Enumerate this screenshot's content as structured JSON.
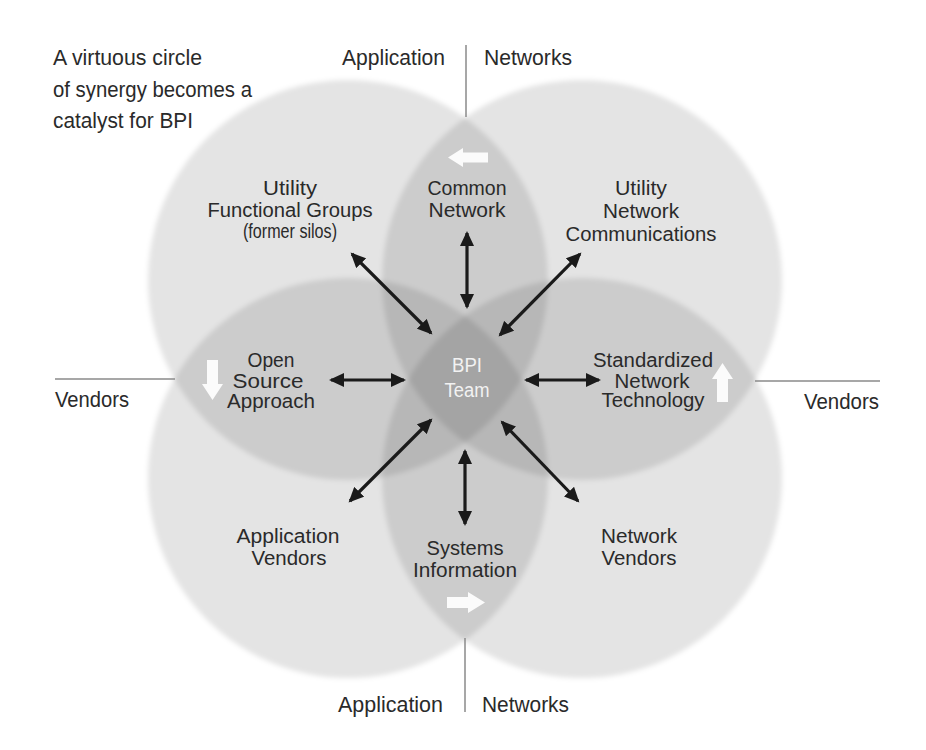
{
  "title": {
    "lines": [
      "A virtuous circle",
      "of synergy becomes a",
      "catalyst for BPI"
    ]
  },
  "axes": {
    "top_left": "Application",
    "top_right": "Networks",
    "bottom_left": "Application",
    "bottom_right": "Networks",
    "left": "Vendors",
    "right": "Vendors"
  },
  "center": {
    "lines": [
      "BPI",
      "Team"
    ]
  },
  "nodes": {
    "utility_functional_groups": [
      "Utility",
      "Functional Groups",
      "(former silos)"
    ],
    "common_network": [
      "Common",
      "Network"
    ],
    "utility_network_communications": [
      "Utility",
      "Network",
      "Communications"
    ],
    "open_source_approach": [
      "Open",
      "Source",
      "Approach"
    ],
    "standardized_network_technology": [
      "Standardized",
      "Network",
      "Technology"
    ],
    "application_vendors": [
      "Application",
      "Vendors"
    ],
    "systems_information": [
      "Systems",
      "Information"
    ],
    "network_vendors": [
      "Network",
      "Vendors"
    ]
  },
  "circles": [
    {
      "name": "top-left",
      "cx": 348,
      "cy": 280,
      "r": 200
    },
    {
      "name": "top-right",
      "cx": 582,
      "cy": 280,
      "r": 200
    },
    {
      "name": "bottom-left",
      "cx": 348,
      "cy": 478,
      "r": 200
    },
    {
      "name": "bottom-right",
      "cx": 582,
      "cy": 478,
      "r": 200
    }
  ],
  "flow_arrows": {
    "top_lens": "arrow-left",
    "left_lens": "arrow-down",
    "right_lens": "arrow-up",
    "bottom_lens": "arrow-right"
  },
  "connections": [
    {
      "from": "BPI Team",
      "to": "Utility Functional Groups (former silos)",
      "type": "bidirectional"
    },
    {
      "from": "BPI Team",
      "to": "Common Network",
      "type": "bidirectional"
    },
    {
      "from": "BPI Team",
      "to": "Utility Network Communications",
      "type": "bidirectional"
    },
    {
      "from": "BPI Team",
      "to": "Open Source Approach",
      "type": "bidirectional"
    },
    {
      "from": "BPI Team",
      "to": "Standardized Network Technology",
      "type": "bidirectional"
    },
    {
      "from": "BPI Team",
      "to": "Application Vendors",
      "type": "bidirectional"
    },
    {
      "from": "BPI Team",
      "to": "Systems Information",
      "type": "bidirectional"
    },
    {
      "from": "BPI Team",
      "to": "Network Vendors",
      "type": "bidirectional"
    }
  ],
  "colors": {
    "text": "#2a2a2a",
    "center_text": "#f2f2f2",
    "axis_line": "#8a8a8a",
    "arrow": "#1a1a1a",
    "flow_arrow": "#ffffff"
  }
}
